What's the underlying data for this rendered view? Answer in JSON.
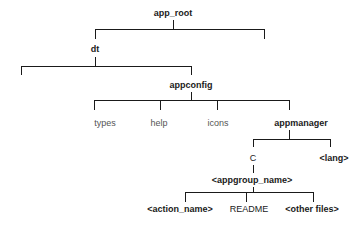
{
  "diagram": {
    "type": "directory-tree",
    "nodes": {
      "app_root": "app_root",
      "dt": "dt",
      "appconfig": "appconfig",
      "types": "types",
      "help": "help",
      "icons": "icons",
      "appmanager": "appmanager",
      "c": "C",
      "lang": "<lang>",
      "appgroup_name": "<appgroup_name>",
      "action_name": "<action_name>",
      "readme": "README",
      "other_files": "<other files>"
    },
    "edges": [
      [
        "app_root",
        "dt"
      ],
      [
        "app_root",
        "(unlabeled)"
      ],
      [
        "dt",
        "(unlabeled)"
      ],
      [
        "dt",
        "appconfig"
      ],
      [
        "appconfig",
        "types"
      ],
      [
        "appconfig",
        "help"
      ],
      [
        "appconfig",
        "icons"
      ],
      [
        "appconfig",
        "appmanager"
      ],
      [
        "appmanager",
        "C"
      ],
      [
        "appmanager",
        "<lang>"
      ],
      [
        "C",
        "<appgroup_name>"
      ],
      [
        "<appgroup_name>",
        "<action_name>"
      ],
      [
        "<appgroup_name>",
        "README"
      ],
      [
        "<appgroup_name>",
        "<other files>"
      ]
    ],
    "colors": {
      "line": "#1a1a1a",
      "text": "#1a1a1a",
      "muted_text": "#555555"
    }
  }
}
